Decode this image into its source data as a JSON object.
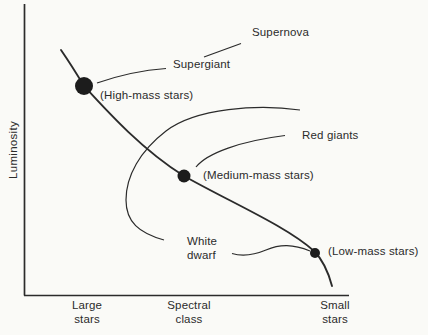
{
  "diagram": {
    "type": "stellar-evolution-diagram",
    "y_axis": {
      "label": "Luminosity"
    },
    "x_axis": {
      "ticks": [
        {
          "line1": "Large",
          "line2": "stars"
        },
        {
          "line1": "Spectral",
          "line2": "class"
        },
        {
          "line1": "Small",
          "line2": "stars"
        }
      ]
    },
    "nodes": {
      "high_mass": "(High-mass stars)",
      "medium_mass": "(Medium-mass stars)",
      "low_mass": "(Low-mass stars)"
    },
    "stages": {
      "supergiant": "Supergiant",
      "supernova": "Supernova",
      "red_giants": "Red giants",
      "white_dwarf": {
        "line1": "White",
        "line2": "dwarf"
      }
    },
    "colors": {
      "ink": "#2b2b2b",
      "background": "#fafaf7"
    }
  }
}
